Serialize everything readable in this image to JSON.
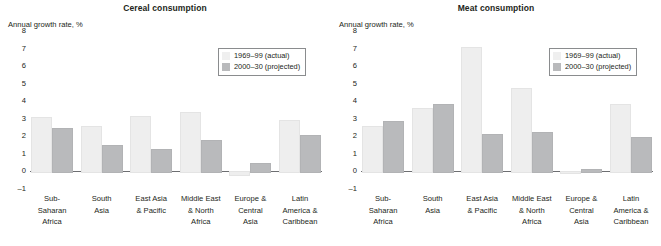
{
  "chart_data": [
    {
      "type": "bar",
      "title": "Cereal consumption",
      "ylabel": "Annual growth rate, %",
      "xlabel": "",
      "ylim": [
        -1,
        8
      ],
      "yticks": [
        "8",
        "7",
        "6",
        "5",
        "4",
        "3",
        "2",
        "1",
        "0",
        "–1"
      ],
      "grid": false,
      "legend_position": "upper-right",
      "categories": [
        "Sub-\nSaharan\nAfrica",
        "South\nAsia",
        "East Asia\n& Pacific",
        "Middle East\n& North\nAfrica",
        "Europe &\nCentral\nAsia",
        "Latin\nAmerica &\nCaribbean"
      ],
      "series": [
        {
          "name": "1969–99 (actual)",
          "values": [
            3.1,
            2.6,
            3.15,
            3.4,
            -0.15,
            2.95
          ]
        },
        {
          "name": "2000–30 (projected)",
          "values": [
            2.45,
            1.5,
            1.3,
            1.8,
            0.5,
            2.1
          ]
        }
      ]
    },
    {
      "type": "bar",
      "title": "Meat consumption",
      "ylabel": "Annual growth rate, %",
      "xlabel": "",
      "ylim": [
        -1,
        8
      ],
      "yticks": [
        "8",
        "7",
        "6",
        "5",
        "4",
        "3",
        "2",
        "1",
        "0",
        "–1"
      ],
      "grid": false,
      "legend_position": "upper-right",
      "categories": [
        "Sub-\nSaharan\nAfrica",
        "South\nAsia",
        "East Asia\n& Pacific",
        "Middle East\n& North\nAfrica",
        "Europe &\nCentral\nAsia",
        "Latin\nAmerica &\nCaribbean"
      ],
      "series": [
        {
          "name": "1969–99 (actual)",
          "values": [
            2.6,
            3.6,
            7.1,
            4.75,
            0.0,
            3.85
          ]
        },
        {
          "name": "2000–30 (projected)",
          "values": [
            2.85,
            3.85,
            2.15,
            2.25,
            0.12,
            1.95
          ]
        }
      ]
    }
  ],
  "colors": {
    "actual": "#eeeeee",
    "projected": "#b9babc",
    "text": "#231f20",
    "axis": "#6d6e71"
  }
}
